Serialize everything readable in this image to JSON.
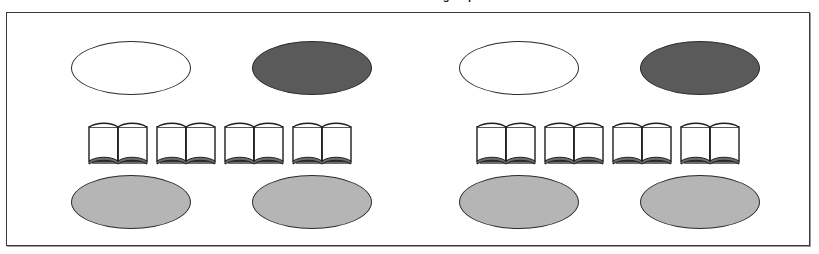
{
  "title": "Phase three: home groups",
  "frame": {
    "border_color": "#3a3a3a",
    "background": "#ffffff",
    "shadow_color": "#9a9a9a"
  },
  "palette": {
    "outline": "#2b2b2b",
    "fill_white": "#ffffff",
    "fill_dark_gray": "#5a5a5a",
    "fill_light_gray": "#b5b5b5",
    "page_white": "#ffffff",
    "book_outline": "#1f1f1f",
    "book_shadow": "#6e6e6e"
  },
  "groups": [
    {
      "name": "home-group-left",
      "ellipses_top": [
        {
          "name": "ellipse-top-left",
          "fill": "white",
          "label": ""
        },
        {
          "name": "ellipse-top-right",
          "fill": "dark",
          "label": ""
        }
      ],
      "books": [
        {
          "name": "book-1",
          "icon": "open-book-icon"
        },
        {
          "name": "book-2",
          "icon": "open-book-icon"
        },
        {
          "name": "book-3",
          "icon": "open-book-icon"
        },
        {
          "name": "book-4",
          "icon": "open-book-icon"
        }
      ],
      "ellipses_bottom": [
        {
          "name": "ellipse-bottom-left",
          "fill": "light",
          "label": ""
        },
        {
          "name": "ellipse-bottom-right",
          "fill": "light",
          "label": ""
        }
      ]
    },
    {
      "name": "home-group-right",
      "ellipses_top": [
        {
          "name": "ellipse-top-left",
          "fill": "white",
          "label": ""
        },
        {
          "name": "ellipse-top-right",
          "fill": "dark",
          "label": ""
        }
      ],
      "books": [
        {
          "name": "book-1",
          "icon": "open-book-icon"
        },
        {
          "name": "book-2",
          "icon": "open-book-icon"
        },
        {
          "name": "book-3",
          "icon": "open-book-icon"
        },
        {
          "name": "book-4",
          "icon": "open-book-icon"
        }
      ],
      "ellipses_bottom": [
        {
          "name": "ellipse-bottom-left",
          "fill": "light",
          "label": ""
        },
        {
          "name": "ellipse-bottom-right",
          "fill": "light",
          "label": ""
        }
      ]
    }
  ]
}
